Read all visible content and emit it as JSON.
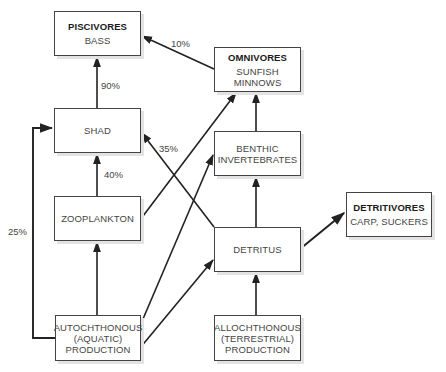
{
  "diagram": {
    "type": "food-web flow diagram",
    "line_color": "#222222",
    "nodes": [
      {
        "id": "piscivores",
        "title": "PISCIVORES",
        "lines": [
          "BASS"
        ]
      },
      {
        "id": "omnivores",
        "title": "OMNIVORES",
        "lines": [
          "SUNFISH",
          "MINNOWS"
        ]
      },
      {
        "id": "shad",
        "title": "",
        "lines": [
          "SHAD"
        ]
      },
      {
        "id": "benthic",
        "title": "",
        "lines": [
          "BENTHIC",
          "INVERTEBRATES"
        ]
      },
      {
        "id": "detritivores",
        "title": "DETRITIVORES",
        "lines": [
          "CARP, SUCKERS"
        ]
      },
      {
        "id": "zooplankton",
        "title": "",
        "lines": [
          "ZOOPLANKTON"
        ]
      },
      {
        "id": "detritus",
        "title": "",
        "lines": [
          "DETRITUS"
        ]
      },
      {
        "id": "autochthonous",
        "title": "",
        "lines": [
          "AUTOCHTHONOUS",
          "(AQUATIC)",
          "PRODUCTION"
        ]
      },
      {
        "id": "allochthonous",
        "title": "",
        "lines": [
          "ALLOCHTHONOUS",
          "(TERRESTRIAL)",
          "PRODUCTION"
        ]
      }
    ],
    "edges": [
      {
        "from": "shad",
        "to": "piscivores",
        "label": "90%"
      },
      {
        "from": "omnivores",
        "to": "piscivores",
        "label": "10%"
      },
      {
        "from": "zooplankton",
        "to": "shad",
        "label": "40%"
      },
      {
        "from": "detritus",
        "to": "shad",
        "label": "35%"
      },
      {
        "from": "autochthonous",
        "to": "shad",
        "label": "25%"
      },
      {
        "from": "zooplankton",
        "to": "omnivores",
        "label": ""
      },
      {
        "from": "benthic",
        "to": "omnivores",
        "label": ""
      },
      {
        "from": "detritus",
        "to": "benthic",
        "label": ""
      },
      {
        "from": "autochthonous",
        "to": "benthic",
        "label": ""
      },
      {
        "from": "autochthonous",
        "to": "zooplankton",
        "label": ""
      },
      {
        "from": "autochthonous",
        "to": "detritus",
        "label": ""
      },
      {
        "from": "allochthonous",
        "to": "detritus",
        "label": ""
      },
      {
        "from": "detritus",
        "to": "detritivores",
        "label": ""
      }
    ]
  }
}
